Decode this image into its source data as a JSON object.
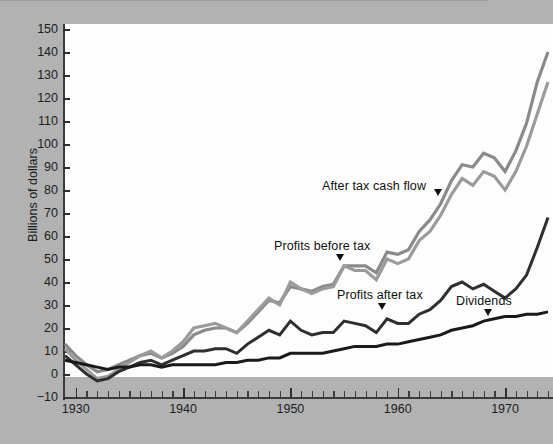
{
  "figure": {
    "background_color": "#b2b2b2",
    "plot_background_color": "#fdfdfd",
    "width": 553,
    "height": 444
  },
  "axes": {
    "y_axis_title": "Billions of dollars",
    "y_ticks": [
      "150",
      "140",
      "130",
      "120",
      "110",
      "100",
      "90",
      "80",
      "70",
      "60",
      "50",
      "40",
      "30",
      "20",
      "10",
      "0",
      "−10"
    ],
    "x_ticks": [
      "1930",
      "1940",
      "1950",
      "1960",
      "1970"
    ]
  },
  "annotations": [
    {
      "id": "after-tax-cash-flow",
      "label": "After  tax cash  flow"
    },
    {
      "id": "profits-before-tax",
      "label": "Profits before tax"
    },
    {
      "id": "profits-after-tax",
      "label": "Profits after tax"
    },
    {
      "id": "dividends",
      "label": "Dividends"
    }
  ],
  "chart_data": {
    "type": "line",
    "title": "",
    "xlabel": "",
    "ylabel": "Billions of dollars",
    "xlim": [
      1929,
      1974
    ],
    "ylim": [
      -10,
      150
    ],
    "grid": false,
    "legend_position": "inline-annotations",
    "x": [
      1929,
      1930,
      1931,
      1932,
      1933,
      1934,
      1935,
      1936,
      1937,
      1938,
      1939,
      1940,
      1941,
      1942,
      1943,
      1944,
      1945,
      1946,
      1947,
      1948,
      1949,
      1950,
      1951,
      1952,
      1953,
      1954,
      1955,
      1956,
      1957,
      1958,
      1959,
      1960,
      1961,
      1962,
      1963,
      1964,
      1965,
      1966,
      1967,
      1968,
      1969,
      1970,
      1971,
      1972,
      1973,
      1974
    ],
    "series": [
      {
        "name": "After  tax cash  flow",
        "color": "#8a8a8a",
        "width": 3.2,
        "values": [
          13,
          8,
          4,
          1,
          2,
          4,
          6,
          8,
          9,
          7,
          9,
          12,
          17,
          19,
          20,
          20,
          18,
          22,
          27,
          32,
          31,
          38,
          37,
          36,
          38,
          39,
          47,
          47,
          47,
          44,
          53,
          52,
          54,
          62,
          67,
          74,
          84,
          91,
          90,
          96,
          94,
          88,
          97,
          109,
          127,
          140
        ]
      },
      {
        "name": "After  tax cash  flow (second line)",
        "color": "#9b9b9b",
        "width": 3.2,
        "values": [
          11,
          6,
          2,
          -2,
          -1,
          2,
          5,
          8,
          10,
          7,
          10,
          14,
          20,
          21,
          22,
          20,
          18,
          23,
          28,
          33,
          30,
          40,
          37,
          35,
          37,
          38,
          47,
          45,
          45,
          41,
          50,
          48,
          50,
          58,
          62,
          69,
          78,
          85,
          82,
          88,
          86,
          80,
          88,
          99,
          113,
          127
        ]
      },
      {
        "name": "Profits after tax",
        "color": "#2f2f2f",
        "width": 3.0,
        "values": [
          8,
          4,
          0,
          -3,
          -2,
          1,
          3,
          5,
          6,
          4,
          6,
          8,
          10,
          10,
          11,
          11,
          9,
          13,
          16,
          19,
          17,
          23,
          19,
          17,
          18,
          18,
          23,
          22,
          21,
          18,
          24,
          22,
          22,
          26,
          28,
          32,
          38,
          40,
          37,
          39,
          36,
          33,
          37,
          43,
          55,
          68
        ]
      },
      {
        "name": "Dividends",
        "color": "#1a1a1a",
        "width": 3.0,
        "values": [
          6,
          5,
          4,
          3,
          2,
          3,
          3,
          4,
          4,
          3,
          4,
          4,
          4,
          4,
          4,
          5,
          5,
          6,
          6,
          7,
          7,
          9,
          9,
          9,
          9,
          10,
          11,
          12,
          12,
          12,
          13,
          13,
          14,
          15,
          16,
          17,
          19,
          20,
          21,
          23,
          24,
          25,
          25,
          26,
          26,
          27
        ]
      }
    ]
  }
}
